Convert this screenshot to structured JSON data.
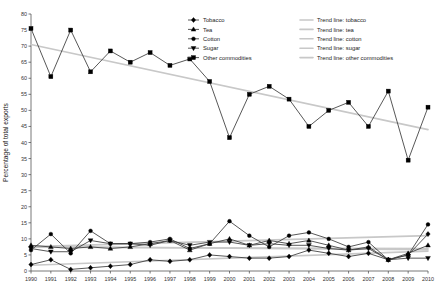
{
  "chart_data": {
    "type": "line",
    "title": "",
    "xlabel": "",
    "ylabel": "Percentage of total exports",
    "xlim": [
      1990,
      2010
    ],
    "ylim": [
      0,
      80
    ],
    "ytick_step": 5,
    "grid": false,
    "legend_position": "top-center",
    "x": [
      1990,
      1991,
      1992,
      1993,
      1994,
      1995,
      1996,
      1997,
      1998,
      1999,
      2000,
      2001,
      2002,
      2003,
      2004,
      2005,
      2006,
      2007,
      2008,
      2009,
      2010
    ],
    "categories": [
      "1990",
      "1991",
      "1992",
      "1993",
      "1994",
      "1995",
      "1996",
      "1997",
      "1998",
      "1999",
      "2000",
      "2001",
      "2002",
      "2003",
      "2004",
      "2005",
      "2006",
      "2007",
      "2008",
      "2009",
      "2010"
    ],
    "series": [
      {
        "name": "Tobacco",
        "marker": "diamond",
        "values": [
          2.0,
          3.5,
          0.5,
          1.0,
          1.5,
          2.0,
          3.5,
          3.0,
          3.5,
          5.0,
          4.5,
          4.0,
          4.0,
          4.5,
          6.5,
          5.5,
          4.5,
          5.5,
          3.5,
          5.0,
          11.5
        ]
      },
      {
        "name": "Tea",
        "marker": "triangle",
        "values": [
          8.0,
          7.5,
          7.0,
          7.5,
          7.0,
          7.5,
          8.5,
          9.5,
          6.5,
          8.5,
          10.0,
          8.0,
          9.5,
          8.5,
          9.5,
          8.0,
          6.5,
          7.5,
          3.5,
          5.5,
          8.0
        ]
      },
      {
        "name": "Cotton",
        "marker": "circle",
        "values": [
          6.5,
          11.5,
          5.5,
          12.5,
          8.5,
          8.5,
          9.0,
          10.0,
          7.0,
          8.5,
          15.5,
          11.0,
          7.5,
          11.0,
          12.0,
          10.0,
          7.5,
          9.0,
          3.5,
          5.0,
          14.5
        ]
      },
      {
        "name": "Sugar",
        "marker": "triangle-down",
        "values": [
          7.0,
          6.0,
          6.0,
          9.5,
          8.5,
          8.5,
          8.0,
          9.5,
          8.0,
          9.0,
          9.0,
          8.0,
          8.5,
          8.0,
          8.0,
          7.0,
          6.5,
          7.0,
          3.5,
          4.0,
          4.0
        ]
      },
      {
        "name": "Other commodities",
        "marker": "square",
        "values": [
          75.5,
          60.5,
          75.0,
          62.0,
          68.5,
          65.0,
          68.0,
          64.0,
          66.0,
          59.0,
          41.5,
          55.0,
          57.5,
          53.5,
          45.0,
          50.0,
          52.5,
          45.0,
          56.0,
          34.5,
          51.0
        ]
      }
    ],
    "trend_lines": [
      {
        "name": "Trend line: tobacco",
        "start": 1.8,
        "end": 6.2
      },
      {
        "name": "Trend line: tea",
        "start": 7.4,
        "end": 7.0
      },
      {
        "name": "Trend line: cotton",
        "start": 7.6,
        "end": 11.0
      },
      {
        "name": "Trend line: sugar",
        "start": 7.6,
        "end": 6.6
      },
      {
        "name": "Trend line: other commodities",
        "start": 70.5,
        "end": 44.0
      }
    ],
    "ytick_labels": [
      "0",
      "5",
      "10",
      "15",
      "20",
      "25",
      "30",
      "35",
      "40",
      "45",
      "50",
      "55",
      "60",
      "65",
      "70",
      "75",
      "80"
    ],
    "legend_series_entries": [
      "Tobacco",
      "Tea",
      "Cotton",
      "Sugar",
      "Other commodities"
    ],
    "legend_trend_entries": [
      "Trend line: tobacco",
      "Trend line: tea",
      "Trend line: cotton",
      "Trend line: sugar",
      "Trend line: other commodities"
    ]
  },
  "colors": {
    "series_line": "#3a3a3a",
    "marker": "#000000",
    "trend_line": "#c8c8c8",
    "axis": "#555555",
    "text": "#222222"
  },
  "clipped_header": ""
}
